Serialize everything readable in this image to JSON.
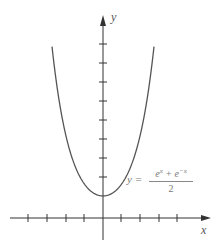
{
  "figure": {
    "type": "function-graph",
    "axis_labels": {
      "x": "x",
      "y": "y"
    },
    "equation": {
      "lhs": "y =",
      "numerator_html": "e^x + e^-x",
      "numerator_parts": [
        "e",
        "x",
        " + ",
        "e",
        "−x"
      ],
      "denominator": "2"
    },
    "colors": {
      "axis": "#333333",
      "curve": "#555555",
      "label": "#777777"
    },
    "x_ticks_px": [
      28,
      47,
      66,
      84,
      121,
      140,
      159,
      177
    ],
    "y_ticks_px": [
      44,
      63,
      82,
      101,
      120,
      139,
      158,
      177
    ],
    "origin_px": [
      103,
      218
    ],
    "curve_min_px": [
      103,
      196
    ]
  }
}
